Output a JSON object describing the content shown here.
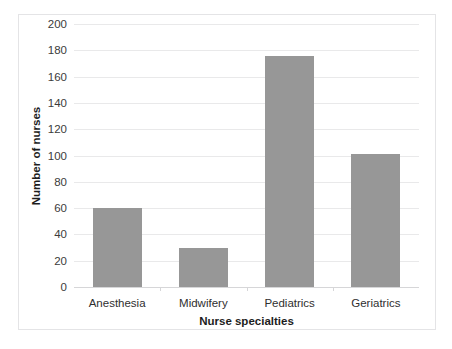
{
  "chart_data": {
    "type": "bar",
    "title": "",
    "categories": [
      "Anesthesia",
      "Midwifery",
      "Pediatrics",
      "Geriatrics"
    ],
    "values": [
      60,
      30,
      176,
      101
    ],
    "series": [
      {
        "name": "Number of nurses",
        "values": [
          60,
          30,
          176,
          101
        ]
      }
    ],
    "xlabel": "Nurse specialties",
    "ylabel": "Number of nurses",
    "ylim": [
      0,
      200
    ],
    "ytick_step": 20,
    "ytick_labels": [
      "0",
      "20",
      "40",
      "60",
      "80",
      "100",
      "120",
      "140",
      "160",
      "180",
      "200"
    ],
    "grid": true,
    "legend": false,
    "legend_position": "none",
    "bar_color": "#979797",
    "gridline_color": "#e9e9ea",
    "axis_color": "#d6d6d8",
    "text_color": "#2f2f2f"
  },
  "clipped_caption": "",
  "accent": "#979797"
}
